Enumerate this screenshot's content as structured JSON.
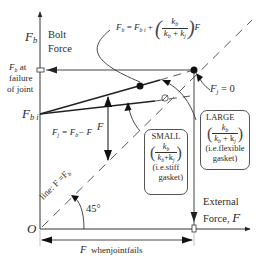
{
  "diagram": {
    "type": "bolted joint load diagram",
    "y_axis": {
      "symbol": "F",
      "symbol_sub": "b",
      "label_line1": "Bolt",
      "label_line2": "Force"
    },
    "x_axis": {
      "label_line1": "External",
      "label_line2": "Force,",
      "symbol": "F"
    },
    "origin_label": "O",
    "fb_failure": {
      "symbol": "F",
      "symbol_sub": "b",
      "text1": "at",
      "text2": "failure",
      "text3": "of joint"
    },
    "fbi_label": {
      "symbol": "F",
      "symbol_sub": "b i"
    },
    "formula_bolt": {
      "lhs": "F",
      "lhs_sub": "b",
      "eq": "=",
      "term1": "F",
      "term1_sub": "b i",
      "plus": "+",
      "num": "k",
      "num_sub": "b",
      "den": "k",
      "den_sub1": "b",
      "den_plus": "+",
      "den2": "k",
      "den_sub2": "j",
      "tail": "F"
    },
    "formula_joint": {
      "lhs": "F",
      "lhs_sub": "j",
      "rhs": "= F",
      "rhs_sub": "b",
      "minus": "− F"
    },
    "fj_zero": {
      "symbol": "F",
      "sub": "j",
      "rhs": "= 0"
    },
    "vertical_arrow_label": "F",
    "line_label": "line: F =F",
    "line_label_sub": "b",
    "angle_label": "45°",
    "small_box": {
      "title": "SMALL",
      "num": "k",
      "num_sub": "b",
      "den": "k",
      "den_sub1": "b",
      "den_plus": "+k",
      "den_sub2": "j",
      "note1": "(i.e.stiff",
      "note2": "gasket)"
    },
    "large_box": {
      "title": "LARGE",
      "num": "k",
      "num_sub": "b",
      "den": "k",
      "den_sub1": "b",
      "den_plus": "+ k",
      "den_sub2": "j",
      "note1": "(i.e.flexible",
      "note2": "gasket)"
    },
    "failure_dimension": {
      "symbol": "F",
      "text": "whenjointfails"
    }
  }
}
